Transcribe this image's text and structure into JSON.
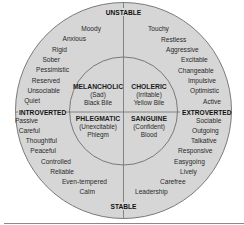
{
  "diagram": {
    "type": "four-temperaments-wheel",
    "colors": {
      "background": "#ffffff",
      "fill": "#d6d6d6",
      "stroke": "#7a7a7a",
      "text": "#2a2a2a"
    },
    "axes": {
      "top": "UNSTABLE",
      "bottom": "STABLE",
      "left": "INTROVERTED",
      "right": "EXTROVERTED"
    },
    "temperaments": {
      "melancholic": {
        "name": "MELANCHOLIC",
        "trait": "(Sad)",
        "humor": "Black Bile"
      },
      "choleric": {
        "name": "CHOLERIC",
        "trait": "(Irritable)",
        "humor": "Yellow Bile"
      },
      "phlegmatic": {
        "name": "PHLEGMATIC",
        "trait": "(Unexcitable)",
        "humor": "Phlegm"
      },
      "sanguine": {
        "name": "SANGUINE",
        "trait": "(Confident)",
        "humor": "Blood"
      }
    },
    "quadrant_traits": {
      "top_left": [
        "Moody",
        "Anxious",
        "Rigid",
        "Sober",
        "Pessimistic",
        "Reserved",
        "Unsociable",
        "Quiet"
      ],
      "top_right": [
        "Touchy",
        "Restless",
        "Aggressive",
        "Excitable",
        "Changeable",
        "Impulsive",
        "Optimistic",
        "Active"
      ],
      "bottom_left": [
        "Passive",
        "Careful",
        "Thoughtful",
        "Peaceful",
        "Controlled",
        "Reliable",
        "Even-tempered",
        "Calm"
      ],
      "bottom_right": [
        "Sociable",
        "Outgoing",
        "Talkative",
        "Responsive",
        "Easygoing",
        "Lively",
        "Carefree",
        "Leadership"
      ]
    }
  }
}
